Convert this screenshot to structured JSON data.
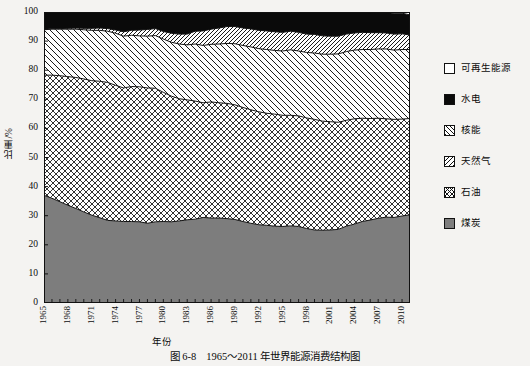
{
  "caption": {
    "number": "图 6-8",
    "text": "1965～2011 年世界能源消费结构图"
  },
  "axes": {
    "y_title": "比重/%",
    "x_title": "年份",
    "y_ticks": [
      "0",
      "10",
      "20",
      "30",
      "40",
      "50",
      "60",
      "70",
      "80",
      "90",
      "100"
    ],
    "x_ticks": [
      "1965",
      "1968",
      "1971",
      "1974",
      "1977",
      "1980",
      "1983",
      "1986",
      "1989",
      "1992",
      "1995",
      "1998",
      "2001",
      "2004",
      "2007",
      "2010"
    ]
  },
  "legend": {
    "items": [
      {
        "label": "可再生能源",
        "pattern": "blank",
        "swatch_name": "legend-swatch-renewable"
      },
      {
        "label": "水电",
        "pattern": "solid-black",
        "swatch_name": "legend-swatch-hydro"
      },
      {
        "label": "核能",
        "pattern": "forward-hatch",
        "swatch_name": "legend-swatch-nuclear"
      },
      {
        "label": "天然气",
        "pattern": "back-hatch",
        "swatch_name": "legend-swatch-gas"
      },
      {
        "label": "石油",
        "pattern": "cross-hatch",
        "swatch_name": "legend-swatch-oil"
      },
      {
        "label": "煤炭",
        "pattern": "solid-gray",
        "swatch_name": "legend-swatch-coal"
      }
    ]
  },
  "chart_data": {
    "type": "area",
    "title": "1965～2011 年世界能源消费结构图",
    "xlabel": "年份",
    "ylabel": "比重/%",
    "xlim": [
      1965,
      2011
    ],
    "ylim": [
      0,
      100
    ],
    "grid": false,
    "stacked": true,
    "legend_position": "right",
    "x": [
      1965,
      1966,
      1967,
      1968,
      1969,
      1970,
      1971,
      1972,
      1973,
      1974,
      1975,
      1976,
      1977,
      1978,
      1979,
      1980,
      1981,
      1982,
      1983,
      1984,
      1985,
      1986,
      1987,
      1988,
      1989,
      1990,
      1991,
      1992,
      1993,
      1994,
      1995,
      1996,
      1997,
      1998,
      1999,
      2000,
      2001,
      2002,
      2003,
      2004,
      2005,
      2006,
      2007,
      2008,
      2009,
      2010,
      2011
    ],
    "series": [
      {
        "name": "煤炭",
        "pattern": "solid-gray",
        "values": [
          37.0,
          36.0,
          34.8,
          33.6,
          32.5,
          31.3,
          30.2,
          29.3,
          28.4,
          28.2,
          28.0,
          28.0,
          27.9,
          27.4,
          27.9,
          28.0,
          27.9,
          28.2,
          28.6,
          28.8,
          29.4,
          29.2,
          29.2,
          29.0,
          28.7,
          28.0,
          27.4,
          26.9,
          26.7,
          26.4,
          26.3,
          26.5,
          26.3,
          25.6,
          25.1,
          25.0,
          25.1,
          25.3,
          26.4,
          27.1,
          28.0,
          28.5,
          29.1,
          29.5,
          29.4,
          29.9,
          30.3
        ]
      },
      {
        "name": "石油",
        "pattern": "cross-hatch",
        "values": [
          41.3,
          42.3,
          43.3,
          44.2,
          45.0,
          45.7,
          46.2,
          46.9,
          47.4,
          46.6,
          45.9,
          46.4,
          46.4,
          46.5,
          45.9,
          44.4,
          43.2,
          42.0,
          41.2,
          40.6,
          39.4,
          39.9,
          39.6,
          39.6,
          39.4,
          39.2,
          39.0,
          38.8,
          38.5,
          38.5,
          38.2,
          38.0,
          38.0,
          38.0,
          38.0,
          37.5,
          37.2,
          36.8,
          36.4,
          36.2,
          35.5,
          34.9,
          34.4,
          33.8,
          33.7,
          33.3,
          33.1
        ]
      },
      {
        "name": "天然气",
        "pattern": "back-hatch",
        "values": [
          15.6,
          15.8,
          16.0,
          16.3,
          16.6,
          16.9,
          17.3,
          17.5,
          17.6,
          17.9,
          17.8,
          17.6,
          17.5,
          17.8,
          18.1,
          18.3,
          18.5,
          18.8,
          18.9,
          19.6,
          19.7,
          19.8,
          20.2,
          20.6,
          21.0,
          21.3,
          21.6,
          21.7,
          21.9,
          21.9,
          22.1,
          22.5,
          22.3,
          22.5,
          22.8,
          23.0,
          23.2,
          23.5,
          23.6,
          23.6,
          23.6,
          23.7,
          23.8,
          24.0,
          23.8,
          23.9,
          23.7
        ]
      },
      {
        "name": "核能",
        "pattern": "forward-hatch",
        "values": [
          0.1,
          0.2,
          0.2,
          0.3,
          0.4,
          0.5,
          0.7,
          0.8,
          0.9,
          1.1,
          1.5,
          1.7,
          2.0,
          2.3,
          2.4,
          2.6,
          3.1,
          3.4,
          3.7,
          4.4,
          5.0,
          5.2,
          5.5,
          5.8,
          5.9,
          6.0,
          6.2,
          6.3,
          6.4,
          6.4,
          6.4,
          6.4,
          6.4,
          6.3,
          6.4,
          6.3,
          6.2,
          6.1,
          6.0,
          5.9,
          5.9,
          5.8,
          5.6,
          5.5,
          5.5,
          5.4,
          5.0
        ]
      },
      {
        "name": "水电",
        "pattern": "solid-black",
        "values": [
          6.0,
          5.7,
          5.7,
          5.6,
          5.5,
          5.6,
          5.6,
          5.5,
          5.7,
          6.2,
          6.8,
          6.3,
          6.2,
          6.0,
          5.7,
          6.7,
          7.3,
          7.6,
          7.6,
          6.6,
          6.5,
          5.9,
          5.5,
          5.0,
          5.0,
          5.5,
          5.8,
          6.3,
          6.5,
          6.8,
          6.9,
          6.6,
          6.9,
          7.5,
          7.6,
          8.1,
          8.2,
          8.2,
          7.5,
          7.1,
          6.9,
          6.9,
          6.8,
          6.9,
          7.2,
          7.1,
          6.9
        ]
      },
      {
        "name": "可再生能源",
        "pattern": "blank",
        "values": [
          0.0,
          0.0,
          0.0,
          0.0,
          0.0,
          0.0,
          0.0,
          0.0,
          0.0,
          0.0,
          0.0,
          0.0,
          0.0,
          0.0,
          0.0,
          0.0,
          0.0,
          0.0,
          0.0,
          0.0,
          0.0,
          0.0,
          0.0,
          0.0,
          0.0,
          0.0,
          0.0,
          0.0,
          0.0,
          0.0,
          0.1,
          0.1,
          0.1,
          0.1,
          0.1,
          0.1,
          0.1,
          0.1,
          0.1,
          0.1,
          0.1,
          0.2,
          0.3,
          0.3,
          0.4,
          0.4,
          1.0
        ]
      }
    ]
  }
}
